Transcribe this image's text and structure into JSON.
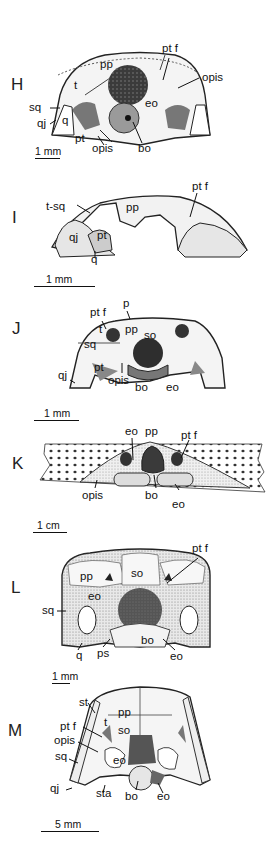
{
  "figure": {
    "panels": [
      {
        "id": "H",
        "letter": "H",
        "labels": [
          "pp",
          "pt f",
          "opis",
          "t",
          "eo",
          "sq",
          "qj",
          "q",
          "pt",
          "opis",
          "bo"
        ],
        "scale_bar": "1 mm"
      },
      {
        "id": "I",
        "letter": "I",
        "labels": [
          "pp",
          "pt f",
          "t-sq",
          "qj",
          "pt",
          "q"
        ],
        "scale_bar": "1 mm"
      },
      {
        "id": "J",
        "letter": "J",
        "labels": [
          "pt f",
          "p",
          "t",
          "pp",
          "so",
          "sq",
          "qj",
          "pt",
          "opis",
          "bo",
          "eo"
        ],
        "scale_bar": "1 mm"
      },
      {
        "id": "K",
        "letter": "K",
        "labels": [
          "eo",
          "pp",
          "pt f",
          "opis",
          "bo",
          "eo"
        ],
        "scale_bar": "1 cm"
      },
      {
        "id": "L",
        "letter": "L",
        "labels": [
          "so",
          "pt f",
          "pp",
          "eo",
          "sq",
          "q",
          "ps",
          "bo",
          "eo"
        ],
        "scale_bar": "1 mm"
      },
      {
        "id": "M",
        "letter": "M",
        "labels": [
          "st",
          "pp",
          "t",
          "pt f",
          "so",
          "opis",
          "sq",
          "eo",
          "qj",
          "sta",
          "bo",
          "eo"
        ],
        "scale_bar": "5 mm"
      }
    ]
  }
}
